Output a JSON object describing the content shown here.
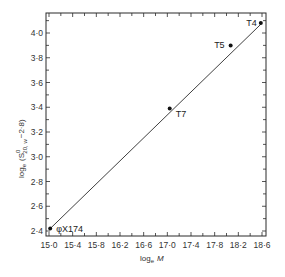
{
  "chart_data": {
    "type": "scatter",
    "title": "",
    "xlabel": "log_e M",
    "ylabel": "log_e (S⁰20,w − 2·8)",
    "xlabel_parts": {
      "main": "log",
      "sub": "e",
      "var": "M"
    },
    "ylabel_parts": {
      "main": "log",
      "sub": "e",
      "open": "(S",
      "sup": "0",
      "sub2": "20, w",
      "rest": "−2·8)"
    },
    "xlim": [
      15.0,
      18.6
    ],
    "ylim": [
      2.4,
      4.1
    ],
    "x_ticks": [
      "15·0",
      "15·4",
      "15·8",
      "16·2",
      "16·6",
      "17·0",
      "17·4",
      "17·8",
      "18·2",
      "18·6"
    ],
    "x_tick_values": [
      15.0,
      15.4,
      15.8,
      16.2,
      16.6,
      17.0,
      17.4,
      17.8,
      18.2,
      18.6
    ],
    "y_ticks": [
      "2·4",
      "2·6",
      "2·8",
      "3·0",
      "3·2",
      "3·4",
      "3·6",
      "3·8",
      "4·0"
    ],
    "y_tick_values": [
      2.4,
      2.6,
      2.8,
      3.0,
      3.2,
      3.4,
      3.6,
      3.8,
      4.0
    ],
    "grid": false,
    "legend": null,
    "points": [
      {
        "label": "φX174",
        "x": 15.02,
        "y": 2.42
      },
      {
        "label": "T7",
        "x": 17.04,
        "y": 3.39
      },
      {
        "label": "T5",
        "x": 18.07,
        "y": 3.9
      },
      {
        "label": "T4",
        "x": 18.58,
        "y": 4.08
      }
    ],
    "fit_line": {
      "x": [
        15.0,
        18.6
      ],
      "y": [
        2.41,
        4.08
      ]
    }
  }
}
